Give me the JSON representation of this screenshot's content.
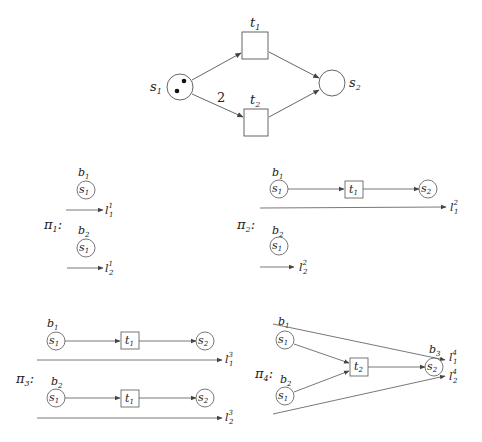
{
  "net": {
    "places": [
      {
        "id": "s1",
        "name": "s",
        "sub": "1",
        "tokens": 2
      },
      {
        "id": "s2",
        "name": "s",
        "sub": "2",
        "tokens": 0
      }
    ],
    "transitions": [
      {
        "id": "t1",
        "name": "t",
        "sub": "1"
      },
      {
        "id": "t2",
        "name": "t",
        "sub": "2"
      }
    ],
    "arc_weight_s1_t2": "2"
  },
  "processes": {
    "pi1": {
      "name": "π",
      "sub": "1",
      "colon": ":",
      "conditions": [
        {
          "name": "b",
          "sub": "1",
          "place": "s",
          "psub": "1"
        },
        {
          "name": "b",
          "sub": "2",
          "place": "s",
          "psub": "1"
        }
      ],
      "lines": [
        {
          "name": "l",
          "sub": "1",
          "sup": "1"
        },
        {
          "name": "l",
          "sub": "2",
          "sup": "1"
        }
      ]
    },
    "pi2": {
      "name": "π",
      "sub": "2",
      "colon": ":",
      "conditions": [
        {
          "name": "b",
          "sub": "1",
          "place": "s",
          "psub": "1"
        },
        {
          "name": "b",
          "sub": "2",
          "place": "s",
          "psub": "1"
        }
      ],
      "events": [
        {
          "name": "t",
          "sub": "1"
        }
      ],
      "outputs": [
        {
          "name": "s",
          "sub": "2"
        }
      ],
      "lines": [
        {
          "name": "l",
          "sub": "1",
          "sup": "2"
        },
        {
          "name": "l",
          "sub": "2",
          "sup": "2"
        }
      ]
    },
    "pi3": {
      "name": "π",
      "sub": "3",
      "colon": ":",
      "conditions": [
        {
          "name": "b",
          "sub": "1",
          "place": "s",
          "psub": "1"
        },
        {
          "name": "b",
          "sub": "2",
          "place": "s",
          "psub": "1"
        }
      ],
      "events": [
        {
          "name": "t",
          "sub": "1"
        },
        {
          "name": "t",
          "sub": "1"
        }
      ],
      "outputs": [
        {
          "name": "s",
          "sub": "2"
        },
        {
          "name": "s",
          "sub": "2"
        }
      ],
      "lines": [
        {
          "name": "l",
          "sub": "1",
          "sup": "3"
        },
        {
          "name": "l",
          "sub": "2",
          "sup": "3"
        }
      ]
    },
    "pi4": {
      "name": "π",
      "sub": "4",
      "colon": ":",
      "conditions": [
        {
          "name": "b",
          "sub": "1",
          "place": "s",
          "psub": "1"
        },
        {
          "name": "b",
          "sub": "2",
          "place": "s",
          "psub": "1"
        },
        {
          "name": "b",
          "sub": "3",
          "place": "s",
          "psub": "2"
        }
      ],
      "events": [
        {
          "name": "t",
          "sub": "2"
        }
      ],
      "lines": [
        {
          "name": "l",
          "sub": "1",
          "sup": "4"
        },
        {
          "name": "l",
          "sub": "2",
          "sup": "4"
        }
      ]
    }
  },
  "colors": {
    "stroke": "#555555",
    "text": "#222222",
    "token": "#111111"
  }
}
